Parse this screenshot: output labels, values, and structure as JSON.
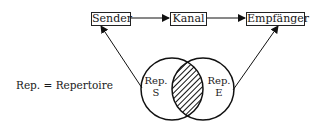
{
  "diagram": {
    "nodes": {
      "sender": "Sender",
      "kanal": "Kanal",
      "empfaenger": "Empfänger"
    },
    "circles": {
      "left": {
        "line1": "Rep.",
        "line2": "S"
      },
      "right": {
        "line1": "Rep.",
        "line2": "E"
      },
      "overlap": "hatched"
    },
    "legend": "Rep. = Repertoire",
    "edges": [
      {
        "from": "Sender",
        "to": "Kanal"
      },
      {
        "from": "Kanal",
        "to": "Empfänger"
      },
      {
        "from": "Rep. S",
        "to": "Sender"
      },
      {
        "from": "Rep. E",
        "to": "Empfänger"
      }
    ]
  }
}
